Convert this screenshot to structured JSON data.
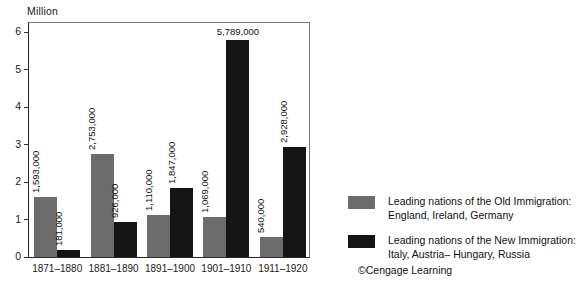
{
  "chart_data": {
    "type": "bar",
    "title": "",
    "ylabel": "Million",
    "xlabel": "",
    "ylim": [
      0,
      6.3
    ],
    "yticks": [
      "0",
      "1",
      "2",
      "3",
      "4",
      "5",
      "6"
    ],
    "ytick_values": [
      0,
      1,
      2,
      3,
      4,
      5,
      6
    ],
    "grid": false,
    "legend_position": "right",
    "categories": [
      "1871–1880",
      "1881–1890",
      "1891–1900",
      "1901–1910",
      "1911–1920"
    ],
    "series": [
      {
        "name": "Leading nations of the Old Immigration: England, Ireland, Germany",
        "color": "#6c6c6c",
        "values": [
          1593000,
          2753000,
          1110000,
          1069000,
          540000
        ],
        "labels": [
          "1,593,000",
          "2,753,000",
          "1,110,000",
          "1,069,000",
          "540,000"
        ]
      },
      {
        "name": "Leading nations of the New Immigration: Italy, Austria– Hungary, Russia",
        "color": "#141414",
        "values": [
          181000,
          926000,
          1847000,
          5789000,
          2928000
        ],
        "labels": [
          "181,000",
          "926,000",
          "1,847,000",
          "5,789,000",
          "2,928,000"
        ]
      }
    ]
  },
  "legend": {
    "items": [
      {
        "swatch": "old",
        "line1": "Leading nations of the Old Immigration:",
        "line2": "England, Ireland, Germany"
      },
      {
        "swatch": "new",
        "line1": "Leading nations of the New Immigration:",
        "line2": "Italy, Austria– Hungary, Russia"
      }
    ]
  },
  "credit": "©Cengage Learning"
}
